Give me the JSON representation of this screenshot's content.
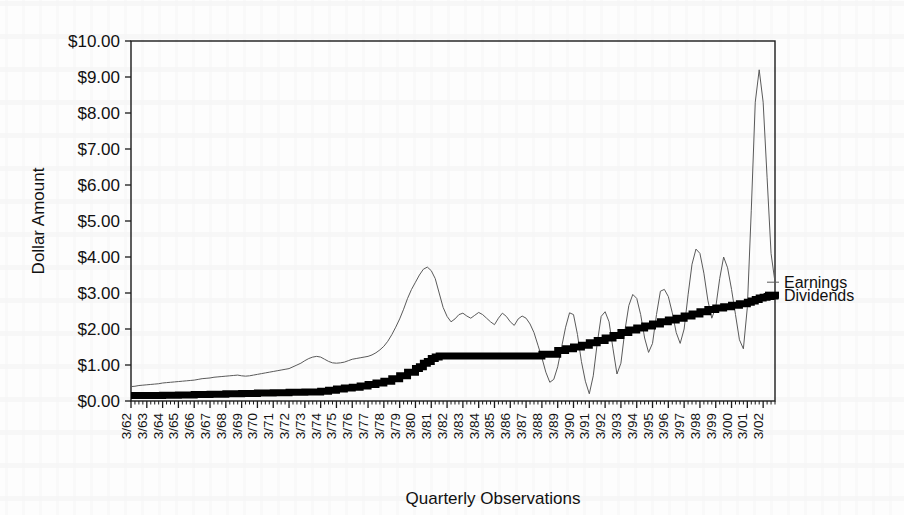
{
  "chart_data": {
    "type": "line",
    "title": "",
    "xlabel": "Quarterly Observations",
    "ylabel": "Dollar Amount",
    "ylim": [
      0,
      10
    ],
    "ytick_labels": [
      "$0.00",
      "$1.00",
      "$2.00",
      "$3.00",
      "$4.00",
      "$5.00",
      "$6.00",
      "$7.00",
      "$8.00",
      "$9.00",
      "$10.00"
    ],
    "ytick_values": [
      0,
      1,
      2,
      3,
      4,
      5,
      6,
      7,
      8,
      9,
      10
    ],
    "grid": false,
    "legend_position": "outside-right",
    "x_major_labels": [
      "3/62",
      "3/63",
      "3/64",
      "3/65",
      "3/66",
      "3/67",
      "3/68",
      "3/69",
      "3/70",
      "3/71",
      "3/72",
      "3/73",
      "3/74",
      "3/75",
      "3/76",
      "3/77",
      "3/78",
      "3/79",
      "3/80",
      "3/81",
      "3/82",
      "3/83",
      "3/84",
      "3/85",
      "3/86",
      "3/87",
      "3/88",
      "3/89",
      "3/90",
      "3/91",
      "3/92",
      "3/93",
      "3/94",
      "3/95",
      "3/96",
      "3/97",
      "3/98",
      "3/99",
      "3/00",
      "3/01",
      "3/02"
    ],
    "x_minor_per_major": 4,
    "series": [
      {
        "name": "Earnings",
        "style": "thin-line",
        "color": "#5a5a5a",
        "values": [
          0.4,
          0.41,
          0.43,
          0.44,
          0.45,
          0.46,
          0.47,
          0.48,
          0.5,
          0.51,
          0.52,
          0.53,
          0.54,
          0.55,
          0.56,
          0.57,
          0.58,
          0.6,
          0.62,
          0.63,
          0.64,
          0.66,
          0.67,
          0.68,
          0.69,
          0.7,
          0.71,
          0.72,
          0.7,
          0.69,
          0.7,
          0.72,
          0.74,
          0.76,
          0.78,
          0.8,
          0.82,
          0.84,
          0.86,
          0.88,
          0.9,
          0.95,
          1.0,
          1.05,
          1.12,
          1.18,
          1.22,
          1.24,
          1.22,
          1.16,
          1.1,
          1.06,
          1.05,
          1.06,
          1.08,
          1.12,
          1.16,
          1.18,
          1.2,
          1.22,
          1.24,
          1.28,
          1.34,
          1.42,
          1.52,
          1.66,
          1.84,
          2.05,
          2.28,
          2.55,
          2.85,
          3.1,
          3.3,
          3.5,
          3.66,
          3.72,
          3.62,
          3.4,
          3.0,
          2.6,
          2.35,
          2.2,
          2.28,
          2.4,
          2.44,
          2.36,
          2.3,
          2.38,
          2.46,
          2.4,
          2.3,
          2.2,
          2.12,
          2.3,
          2.44,
          2.35,
          2.2,
          2.1,
          2.28,
          2.36,
          2.3,
          2.14,
          1.9,
          1.55,
          1.2,
          0.8,
          0.52,
          0.6,
          0.95,
          1.5,
          2.05,
          2.45,
          2.4,
          1.85,
          1.1,
          0.55,
          0.2,
          0.7,
          1.6,
          2.35,
          2.48,
          2.2,
          1.45,
          0.75,
          1.05,
          1.95,
          2.65,
          2.96,
          2.85,
          2.4,
          1.75,
          1.35,
          1.6,
          2.4,
          3.05,
          3.1,
          2.9,
          2.45,
          1.9,
          1.6,
          2.0,
          2.95,
          3.8,
          4.22,
          4.1,
          3.55,
          2.8,
          2.3,
          2.6,
          3.4,
          4.0,
          3.7,
          3.1,
          2.4,
          1.7,
          1.45,
          2.6,
          5.3,
          8.3,
          9.2,
          8.3,
          6.2,
          4.1,
          3.3
        ]
      },
      {
        "name": "Dividends",
        "style": "thick-step-line",
        "color": "#000000",
        "values": [
          0.15,
          0.15,
          0.15,
          0.15,
          0.15,
          0.15,
          0.15,
          0.15,
          0.16,
          0.16,
          0.16,
          0.16,
          0.17,
          0.17,
          0.17,
          0.17,
          0.18,
          0.18,
          0.18,
          0.18,
          0.19,
          0.19,
          0.19,
          0.19,
          0.2,
          0.2,
          0.2,
          0.2,
          0.21,
          0.21,
          0.21,
          0.21,
          0.22,
          0.22,
          0.22,
          0.22,
          0.23,
          0.23,
          0.23,
          0.23,
          0.24,
          0.24,
          0.24,
          0.24,
          0.25,
          0.25,
          0.25,
          0.25,
          0.27,
          0.27,
          0.3,
          0.3,
          0.33,
          0.33,
          0.36,
          0.36,
          0.38,
          0.38,
          0.42,
          0.42,
          0.46,
          0.46,
          0.5,
          0.5,
          0.55,
          0.55,
          0.62,
          0.62,
          0.7,
          0.7,
          0.8,
          0.8,
          0.9,
          0.95,
          1.05,
          1.1,
          1.18,
          1.22,
          1.25,
          1.25,
          1.25,
          1.25,
          1.25,
          1.25,
          1.25,
          1.25,
          1.25,
          1.25,
          1.25,
          1.25,
          1.25,
          1.25,
          1.25,
          1.25,
          1.25,
          1.25,
          1.25,
          1.25,
          1.25,
          1.25,
          1.25,
          1.25,
          1.25,
          1.25,
          1.3,
          1.3,
          1.3,
          1.3,
          1.4,
          1.4,
          1.45,
          1.45,
          1.5,
          1.5,
          1.55,
          1.55,
          1.62,
          1.62,
          1.68,
          1.68,
          1.75,
          1.75,
          1.82,
          1.82,
          1.9,
          1.9,
          1.97,
          1.97,
          2.03,
          2.03,
          2.08,
          2.08,
          2.14,
          2.14,
          2.2,
          2.2,
          2.25,
          2.25,
          2.3,
          2.3,
          2.36,
          2.36,
          2.42,
          2.42,
          2.48,
          2.48,
          2.54,
          2.54,
          2.58,
          2.58,
          2.62,
          2.62,
          2.66,
          2.66,
          2.7,
          2.7,
          2.74,
          2.78,
          2.82,
          2.86,
          2.88,
          2.9,
          2.92,
          2.94
        ]
      }
    ]
  },
  "legend": {
    "entries": [
      {
        "label": "Earnings"
      },
      {
        "label": "Dividends"
      }
    ]
  }
}
